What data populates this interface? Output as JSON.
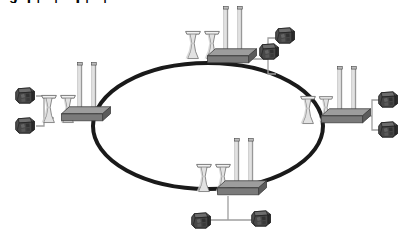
{
  "diagram": {
    "type": "network-topology-ring",
    "title": "Ring network topology of power plant sites",
    "canvas": {
      "width": 408,
      "height": 236,
      "background": "#ffffff"
    },
    "colors": {
      "ring_stroke": "#1a1a1a",
      "plant_base_top": "#9a9a9a",
      "plant_base_front": "#6f6f6f",
      "plant_base_side": "#5a5a5a",
      "plant_base_outline": "#3d3d3d",
      "stack_fill": "#d8d8d8",
      "stack_outline": "#5a5a5a",
      "tower_fill": "#e2e2e2",
      "tower_outline": "#6a6a6a",
      "cluster_fill": "#4a4a4a",
      "cluster_dark": "#2b2b2b",
      "cluster_light": "#747474",
      "cluster_outline": "#1e1e1e",
      "link_line": "#9e9e9e"
    },
    "ring": {
      "label": "ring-backbone",
      "center_x": 208,
      "center_y": 126,
      "radius_x": 115,
      "radius_y": 63,
      "stroke_width": 4
    },
    "nodes": [
      {
        "id": "node-top",
        "label": "top-power-plant",
        "position": {
          "x": 224,
          "y": 58
        },
        "cooling_towers": 2,
        "smokestacks": 2,
        "clusters_side": "right",
        "clusters": 2
      },
      {
        "id": "node-right",
        "label": "right-power-plant",
        "position": {
          "x": 333,
          "y": 117
        },
        "cooling_towers": 2,
        "smokestacks": 2,
        "clusters_side": "right",
        "clusters": 2
      },
      {
        "id": "node-bottom",
        "label": "bottom-power-plant",
        "position": {
          "x": 228,
          "y": 190
        },
        "cooling_towers": 2,
        "smokestacks": 2,
        "clusters_side": "below",
        "clusters": 2
      },
      {
        "id": "node-left",
        "label": "left-power-plant",
        "position": {
          "x": 76,
          "y": 116
        },
        "cooling_towers": 2,
        "smokestacks": 2,
        "clusters_side": "left",
        "clusters": 2
      }
    ]
  }
}
